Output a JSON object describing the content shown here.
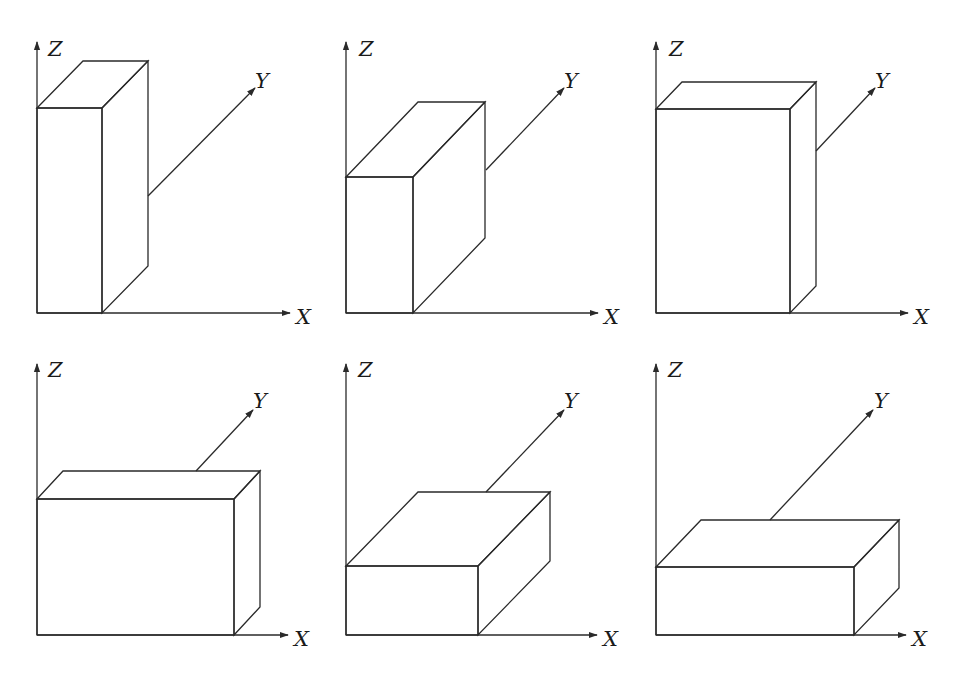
{
  "figure": {
    "stroke_color": "#2a2a2a",
    "background": "#ffffff"
  },
  "panels": [
    {
      "id": "panel-1",
      "axis_labels": {
        "x": "X",
        "y": "Y",
        "z": "Z"
      },
      "origin": [
        37,
        313
      ],
      "z_axis_top": 42,
      "x_axis_end": 290,
      "y_axis": {
        "start": [
          148,
          196
        ],
        "end": [
          255,
          88
        ],
        "label_pos": [
          255,
          88
        ]
      },
      "z_label_pos": [
        48,
        56
      ],
      "x_label_pos": [
        296,
        324
      ],
      "box": {
        "front": [
          37,
          108,
          102,
          313
        ],
        "depth_dx": 46,
        "depth_dy": -47
      }
    },
    {
      "id": "panel-2",
      "axis_labels": {
        "x": "X",
        "y": "Y",
        "z": "Z"
      },
      "origin": [
        346,
        313
      ],
      "z_axis_top": 42,
      "x_axis_end": 598,
      "y_axis": {
        "start": [
          486,
          170
        ],
        "end": [
          564,
          88
        ],
        "label_pos": [
          564,
          88
        ]
      },
      "z_label_pos": [
        359,
        56
      ],
      "x_label_pos": [
        604,
        324
      ],
      "box": {
        "front": [
          346,
          177,
          413,
          313
        ],
        "depth_dx": 72,
        "depth_dy": -75
      }
    },
    {
      "id": "panel-3",
      "axis_labels": {
        "x": "X",
        "y": "Y",
        "z": "Z"
      },
      "origin": [
        656,
        313
      ],
      "z_axis_top": 42,
      "x_axis_end": 908,
      "y_axis": {
        "start": [
          816,
          151
        ],
        "end": [
          875,
          88
        ],
        "label_pos": [
          875,
          88
        ]
      },
      "z_label_pos": [
        669,
        56
      ],
      "x_label_pos": [
        914,
        324
      ],
      "box": {
        "front": [
          656,
          109,
          790,
          313
        ],
        "depth_dx": 26,
        "depth_dy": -27
      }
    },
    {
      "id": "panel-4",
      "axis_labels": {
        "x": "X",
        "y": "Y",
        "z": "Z"
      },
      "origin": [
        37,
        635
      ],
      "z_axis_top": 364,
      "x_axis_end": 288,
      "y_axis": {
        "start": [
          196,
          471
        ],
        "end": [
          253,
          410
        ],
        "label_pos": [
          253,
          408
        ]
      },
      "z_label_pos": [
        48,
        377
      ],
      "x_label_pos": [
        294,
        646
      ],
      "box": {
        "front": [
          37,
          499,
          234,
          635
        ],
        "depth_dx": 26,
        "depth_dy": -28
      }
    },
    {
      "id": "panel-5",
      "axis_labels": {
        "x": "X",
        "y": "Y",
        "z": "Z"
      },
      "origin": [
        346,
        635
      ],
      "z_axis_top": 364,
      "x_axis_end": 597,
      "y_axis": {
        "start": [
          486,
          492
        ],
        "end": [
          564,
          410
        ],
        "label_pos": [
          564,
          408
        ]
      },
      "z_label_pos": [
        358,
        377
      ],
      "x_label_pos": [
        603,
        646
      ],
      "box": {
        "front": [
          346,
          566,
          478,
          635
        ],
        "depth_dx": 72,
        "depth_dy": -74
      }
    },
    {
      "id": "panel-6",
      "axis_labels": {
        "x": "X",
        "y": "Y",
        "z": "Z"
      },
      "origin": [
        656,
        635
      ],
      "z_axis_top": 364,
      "x_axis_end": 906,
      "y_axis": {
        "start": [
          770,
          520
        ],
        "end": [
          873,
          410
        ],
        "label_pos": [
          874,
          408
        ]
      },
      "z_label_pos": [
        668,
        377
      ],
      "x_label_pos": [
        912,
        646
      ],
      "box": {
        "front": [
          656,
          567,
          854,
          635
        ],
        "depth_dx": 45,
        "depth_dy": -47
      }
    }
  ]
}
